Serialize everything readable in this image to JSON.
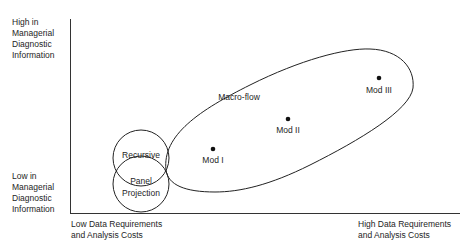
{
  "y_axis": {
    "top_label": "High in\nManagerial\nDiagnostic\nInformation",
    "bottom_label": "Low in\nManagerial\nDiagnostic\nInformation"
  },
  "x_axis": {
    "left_label": "Low Data Requirements\nand Analysis Costs",
    "right_label": "High Data Requirements\nand Analysis Costs"
  },
  "regions": {
    "recursive": "Recursive",
    "panel_line1": "Panel",
    "panel_line2": "Projection",
    "macro_flow": "Macro-flow"
  },
  "points": [
    {
      "label": "Mod I"
    },
    {
      "label": "Mod II"
    },
    {
      "label": "Mod III"
    }
  ],
  "colors": {
    "ink": "#1e1e1e",
    "background": "#ffffff"
  }
}
